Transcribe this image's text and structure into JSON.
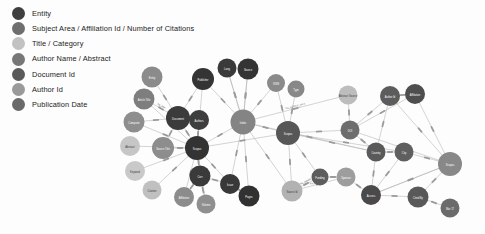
{
  "legend": {
    "items": [
      {
        "label": "Entity",
        "color": "#3f3f3f",
        "key": "entity"
      },
      {
        "label": "Subject Area / Affiliation Id / Number of Citations",
        "color": "#6e6e6e",
        "key": "subject-area"
      },
      {
        "label": "Title / Category",
        "color": "#c2c2c2",
        "key": "title-category"
      },
      {
        "label": "Author Name / Abstract",
        "color": "#777777",
        "key": "author-name"
      },
      {
        "label": "Document Id",
        "color": "#5a5a5a",
        "key": "document-id"
      },
      {
        "label": "Author Id",
        "color": "#9a9a9a",
        "key": "author-id"
      },
      {
        "label": "Publication Date",
        "color": "#6a6a6a",
        "key": "publication-date"
      }
    ]
  },
  "graph": {
    "edge_color": "#b0b0b0",
    "nodes": [
      {
        "id": "n1",
        "label": "Entity",
        "x": 152,
        "y": 77,
        "r": 10.5,
        "color": "#8b8b8b",
        "light": false
      },
      {
        "id": "n2",
        "label": "Article Title",
        "x": 144,
        "y": 99,
        "r": 10.5,
        "color": "#7e7e7e",
        "light": false
      },
      {
        "id": "n3",
        "label": "Computer",
        "x": 134,
        "y": 122,
        "r": 10.5,
        "color": "#8e8e8e",
        "light": false
      },
      {
        "id": "n4",
        "label": "Abstract",
        "x": 130,
        "y": 146,
        "r": 10.0,
        "color": "#c6c6c6",
        "light": true
      },
      {
        "id": "n5",
        "label": "Keyword",
        "x": 135,
        "y": 171,
        "r": 10.0,
        "color": "#c9c9c9",
        "light": true
      },
      {
        "id": "n6",
        "label": "Citation",
        "x": 152,
        "y": 190,
        "r": 9.5,
        "color": "#c0c0c0",
        "light": true
      },
      {
        "id": "n7",
        "label": "Source Title",
        "x": 163,
        "y": 148,
        "r": 11.0,
        "color": "#8d8d8d",
        "light": false
      },
      {
        "id": "n8",
        "label": "Document",
        "x": 178,
        "y": 118,
        "r": 12.0,
        "color": "#3b3b3b",
        "light": false
      },
      {
        "id": "n9",
        "label": "Authors",
        "x": 199,
        "y": 120,
        "r": 10.0,
        "color": "#3e3e3e",
        "light": false
      },
      {
        "id": "n10",
        "label": "Scopus",
        "x": 197,
        "y": 148,
        "r": 12.0,
        "color": "#333333",
        "light": false
      },
      {
        "id": "n11",
        "label": "Corr",
        "x": 200,
        "y": 176,
        "r": 10.5,
        "color": "#3a3a3a",
        "light": false
      },
      {
        "id": "n12",
        "label": "Affiliation",
        "x": 184,
        "y": 197,
        "r": 10.0,
        "color": "#8c8c8c",
        "light": false
      },
      {
        "id": "n13",
        "label": "Volume",
        "x": 206,
        "y": 204,
        "r": 9.5,
        "color": "#8f8f8f",
        "light": false
      },
      {
        "id": "n14",
        "label": "Issue",
        "x": 230,
        "y": 184,
        "r": 10.0,
        "color": "#383838",
        "light": false
      },
      {
        "id": "n15",
        "label": "Pages",
        "x": 249,
        "y": 196,
        "r": 10.5,
        "color": "#313131",
        "light": false
      },
      {
        "id": "n16",
        "label": "Publisher",
        "x": 203,
        "y": 79,
        "r": 11.0,
        "color": "#343434",
        "light": false
      },
      {
        "id": "n17",
        "label": "Lang",
        "x": 227,
        "y": 68,
        "r": 9.5,
        "color": "#3a3a3a",
        "light": false
      },
      {
        "id": "n18",
        "label": "Source",
        "x": 248,
        "y": 69,
        "r": 10.5,
        "color": "#343434",
        "light": false
      },
      {
        "id": "n19",
        "label": "Index",
        "x": 243,
        "y": 122,
        "r": 12.5,
        "color": "#848484",
        "light": false
      },
      {
        "id": "n20",
        "label": "ISSN",
        "x": 276,
        "y": 83,
        "r": 9.0,
        "color": "#8a8a8a",
        "light": false
      },
      {
        "id": "n21",
        "label": "Type",
        "x": 296,
        "y": 89,
        "r": 8.5,
        "color": "#888888",
        "light": false
      },
      {
        "id": "n22",
        "label": "Scopus",
        "x": 288,
        "y": 133,
        "r": 12.0,
        "color": "#575757",
        "light": false
      },
      {
        "id": "n23",
        "label": "Abstract Source",
        "x": 348,
        "y": 95,
        "r": 9.5,
        "color": "#bdbdbd",
        "light": true
      },
      {
        "id": "n24",
        "label": "DOI",
        "x": 350,
        "y": 130,
        "r": 9.5,
        "color": "#6d6d6d",
        "light": false
      },
      {
        "id": "n25",
        "label": "Author Id",
        "x": 390,
        "y": 96,
        "r": 10.0,
        "color": "#5c5c5c",
        "light": false
      },
      {
        "id": "n26",
        "label": "Affiliation",
        "x": 415,
        "y": 94,
        "r": 10.0,
        "color": "#4e4e4e",
        "light": false
      },
      {
        "id": "n27",
        "label": "Country",
        "x": 376,
        "y": 152,
        "r": 9.5,
        "color": "#5a5a5a",
        "light": false
      },
      {
        "id": "n28",
        "label": "City",
        "x": 404,
        "y": 152,
        "r": 9.5,
        "color": "#5f5f5f",
        "light": false
      },
      {
        "id": "n29",
        "label": "Funding",
        "x": 320,
        "y": 177,
        "r": 8.5,
        "color": "#5d5d5d",
        "light": false
      },
      {
        "id": "n30",
        "label": "Sponsor",
        "x": 346,
        "y": 177,
        "r": 9.5,
        "color": "#9d9d9d",
        "light": false
      },
      {
        "id": "n31",
        "label": "Access",
        "x": 371,
        "y": 195,
        "r": 10.0,
        "color": "#4a4a4a",
        "light": false
      },
      {
        "id": "n32",
        "label": "Source Id",
        "x": 292,
        "y": 191,
        "r": 10.5,
        "color": "#b2b2b2",
        "light": true
      },
      {
        "id": "n33",
        "label": "Scopus",
        "x": 450,
        "y": 164,
        "r": 12.0,
        "color": "#888888",
        "light": false
      },
      {
        "id": "n34",
        "label": "Cited By",
        "x": 418,
        "y": 197,
        "r": 10.5,
        "color": "#595959",
        "light": false
      },
      {
        "id": "n35",
        "label": "Mar 17",
        "x": 450,
        "y": 208,
        "r": 9.5,
        "color": "#6b6b6b",
        "light": false
      }
    ],
    "edges": [
      {
        "from": "n1",
        "to": "n8",
        "label": ""
      },
      {
        "from": "n2",
        "to": "n8",
        "label": "ha_title"
      },
      {
        "from": "n3",
        "to": "n8",
        "label": ""
      },
      {
        "from": "n4",
        "to": "n10",
        "label": ""
      },
      {
        "from": "n5",
        "to": "n10",
        "label": ""
      },
      {
        "from": "n6",
        "to": "n10",
        "label": ""
      },
      {
        "from": "n7",
        "to": "n10",
        "label": ""
      },
      {
        "from": "n7",
        "to": "n8",
        "label": ""
      },
      {
        "from": "n8",
        "to": "n9",
        "label": ""
      },
      {
        "from": "n8",
        "to": "n10",
        "label": ""
      },
      {
        "from": "n9",
        "to": "n10",
        "label": ""
      },
      {
        "from": "n10",
        "to": "n11",
        "label": ""
      },
      {
        "from": "n11",
        "to": "n12",
        "label": ""
      },
      {
        "from": "n11",
        "to": "n13",
        "label": ""
      },
      {
        "from": "n11",
        "to": "n14",
        "label": ""
      },
      {
        "from": "n14",
        "to": "n15",
        "label": ""
      },
      {
        "from": "n10",
        "to": "n19",
        "label": ""
      },
      {
        "from": "n16",
        "to": "n19",
        "label": ""
      },
      {
        "from": "n17",
        "to": "n19",
        "label": ""
      },
      {
        "from": "n18",
        "to": "n19",
        "label": ""
      },
      {
        "from": "n19",
        "to": "n20",
        "label": ""
      },
      {
        "from": "n19",
        "to": "n22",
        "label": ""
      },
      {
        "from": "n20",
        "to": "n22",
        "label": ""
      },
      {
        "from": "n21",
        "to": "n22",
        "label": ""
      },
      {
        "from": "n19",
        "to": "n23",
        "label": "ha_subject_area"
      },
      {
        "from": "n22",
        "to": "n24",
        "label": ""
      },
      {
        "from": "n23",
        "to": "n24",
        "label": ""
      },
      {
        "from": "n24",
        "to": "n25",
        "label": ""
      },
      {
        "from": "n24",
        "to": "n27",
        "label": ""
      },
      {
        "from": "n25",
        "to": "n26",
        "label": ""
      },
      {
        "from": "n25",
        "to": "n27",
        "label": ""
      },
      {
        "from": "n26",
        "to": "n33",
        "label": ""
      },
      {
        "from": "n27",
        "to": "n28",
        "label": ""
      },
      {
        "from": "n28",
        "to": "n33",
        "label": ""
      },
      {
        "from": "n22",
        "to": "n29",
        "label": ""
      },
      {
        "from": "n29",
        "to": "n30",
        "label": ""
      },
      {
        "from": "n30",
        "to": "n31",
        "label": ""
      },
      {
        "from": "n31",
        "to": "n33",
        "label": ""
      },
      {
        "from": "n31",
        "to": "n34",
        "label": ""
      },
      {
        "from": "n33",
        "to": "n34",
        "label": ""
      },
      {
        "from": "n34",
        "to": "n35",
        "label": ""
      },
      {
        "from": "n32",
        "to": "n29",
        "label": "ha_patent"
      },
      {
        "from": "n32",
        "to": "n30",
        "label": "ha_affiliation_id"
      },
      {
        "from": "n22",
        "to": "n32",
        "label": ""
      },
      {
        "from": "n10",
        "to": "n22",
        "label": ""
      },
      {
        "from": "n19",
        "to": "n27",
        "label": ""
      },
      {
        "from": "n19",
        "to": "n32",
        "label": ""
      },
      {
        "from": "n22",
        "to": "n27",
        "label": ""
      },
      {
        "from": "n24",
        "to": "n33",
        "label": ""
      },
      {
        "from": "n27",
        "to": "n31",
        "label": ""
      },
      {
        "from": "n28",
        "to": "n31",
        "label": ""
      },
      {
        "from": "n22",
        "to": "n28",
        "label": ""
      },
      {
        "from": "n8",
        "to": "n16",
        "label": ""
      },
      {
        "from": "n10",
        "to": "n16",
        "label": ""
      },
      {
        "from": "n10",
        "to": "n14",
        "label": ""
      },
      {
        "from": "n10",
        "to": "n12",
        "label": ""
      },
      {
        "from": "n10",
        "to": "n13",
        "label": ""
      },
      {
        "from": "n10",
        "to": "n2",
        "label": ""
      },
      {
        "from": "n10",
        "to": "n3",
        "label": ""
      },
      {
        "from": "n19",
        "to": "n17",
        "label": ""
      },
      {
        "from": "n19",
        "to": "n18",
        "label": ""
      },
      {
        "from": "n19",
        "to": "n15",
        "label": ""
      },
      {
        "from": "n19",
        "to": "n14",
        "label": ""
      },
      {
        "from": "n26",
        "to": "n24",
        "label": ""
      },
      {
        "from": "n25",
        "to": "n33",
        "label": ""
      },
      {
        "from": "n33",
        "to": "n31",
        "label": ""
      }
    ]
  }
}
